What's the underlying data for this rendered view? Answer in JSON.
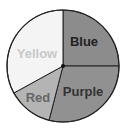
{
  "chart_data": {
    "type": "pie",
    "title": "",
    "categories": [
      "Blue",
      "Purple",
      "Red",
      "Yellow"
    ],
    "values": [
      25,
      29,
      13,
      33
    ],
    "start_angle_deg": 0,
    "direction": "clockwise",
    "slice_colors": [
      "#8c8c8c",
      "#919191",
      "#b4b4b4",
      "#f4f4f4"
    ],
    "label_colors": [
      "#222222",
      "#333333",
      "#666666",
      "#c8c8c8"
    ]
  },
  "labels": {
    "blue": "Blue",
    "purple": "Purple",
    "red": "Red",
    "yellow": "Yellow"
  }
}
